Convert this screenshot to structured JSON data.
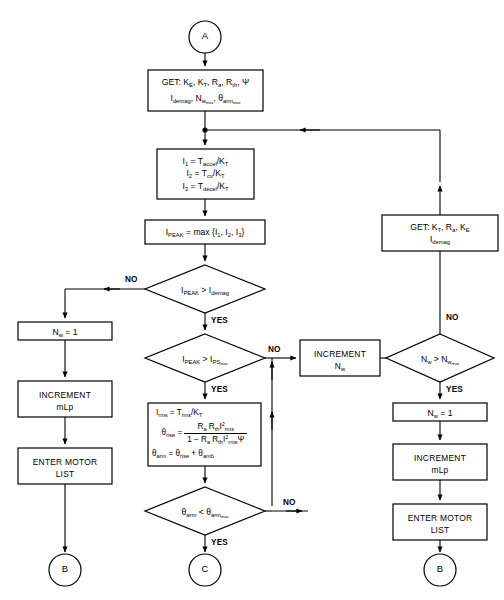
{
  "diagram": {
    "background_color": "#ffffff",
    "line_color": "#000000"
  },
  "terminals": {
    "a": "A",
    "b_left": "B",
    "c_center": "C",
    "b_right": "B"
  },
  "nodes": {
    "get_params": {
      "line1": "GET: K",
      "line1_sub1": "E",
      "line1_b": ", K",
      "line1_sub2": "T",
      "line1_c": ", R",
      "line1_sub3": "a",
      "line1_d": ", R",
      "line1_sub4": "th",
      "line1_e": ", Ψ",
      "line2_a": "I",
      "line2_sub1": "demag",
      "line2_b": ", N",
      "line2_sub2": "w",
      "line2_sub2b": "max",
      "line2_c": ", θ",
      "line2_sub3": "arm",
      "line2_sub3b": "max"
    },
    "currents": {
      "eq1": "I₁ = T_accel/K_T",
      "eq2": "I₂ = T_cv/K_T",
      "eq3": "I₃ = T_decel/K_T"
    },
    "ipeak": {
      "text": "I_PEAK = max {I₁, I₂, I₃}"
    },
    "decision_demag": {
      "text": "I_PEAK > I_demag",
      "yes_label": "YES",
      "no_label": "NO"
    },
    "decision_psmax": {
      "text": "I_PEAK > I_PSmax",
      "yes_label": "YES",
      "no_label": "NO"
    },
    "thermal": {
      "eq1": "I_rms = T_rms/K_T",
      "eq2_lhs": "θ_rise =",
      "eq2_num": "R_a R_th I²_rms",
      "eq2_den": "1 − R_a R_th I²_rms Ψ",
      "eq3": "θ_arm = θ_rise + θ_amb"
    },
    "decision_theta": {
      "text": "θ_arm < θ_armmax",
      "yes_label": "YES",
      "no_label": "NO"
    },
    "nw_one_left": {
      "text": "N_w = 1"
    },
    "increment_mlp_left": {
      "line1": "INCREMENT",
      "line2": "mLp"
    },
    "enter_motor_list_left": {
      "line1": "ENTER MOTOR",
      "line2": "LIST"
    },
    "increment_nw": {
      "line1": "INCREMENT",
      "line2": "N_w"
    },
    "decision_nw": {
      "text": "N_w > N_wmax",
      "yes_label": "YES",
      "no_label": "NO"
    },
    "get_params_right": {
      "line1": "GET: K_T, R_a, K_E",
      "line2": "I_demag"
    },
    "nw_one_right": {
      "text": "N_w = 1"
    },
    "increment_mlp_right": {
      "line1": "INCREMENT",
      "line2": "mLp"
    },
    "enter_motor_list_right": {
      "line1": "ENTER MOTOR",
      "line2": "LIST"
    }
  },
  "edge_labels": {
    "no_demag": "NO",
    "yes_demag": "YES",
    "no_psmax": "NO",
    "yes_psmax": "YES",
    "no_theta": "NO",
    "yes_theta": "YES",
    "no_nw": "NO",
    "yes_nw": "YES"
  }
}
